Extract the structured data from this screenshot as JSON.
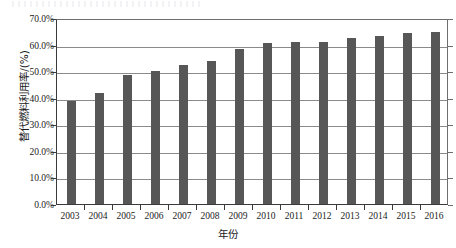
{
  "chart_data": {
    "type": "bar",
    "title": "",
    "xlabel": "年份",
    "ylabel": "替代燃料利用率/(%)",
    "categories": [
      "2003",
      "2004",
      "2005",
      "2006",
      "2007",
      "2008",
      "2009",
      "2010",
      "2011",
      "2012",
      "2013",
      "2014",
      "2015",
      "2016"
    ],
    "values": [
      38.7,
      41.8,
      48.5,
      50.0,
      52.2,
      53.8,
      58.3,
      60.7,
      60.8,
      60.8,
      62.4,
      63.2,
      64.3,
      64.6
    ],
    "series": [
      {
        "name": "替代燃料利用率",
        "values": [
          38.7,
          41.8,
          48.5,
          50.0,
          52.2,
          53.8,
          58.3,
          60.7,
          60.8,
          60.8,
          62.4,
          63.2,
          64.3,
          64.6
        ]
      }
    ],
    "ylim": [
      0,
      70
    ],
    "ytick_values": [
      0,
      10,
      20,
      30,
      40,
      50,
      60,
      70
    ],
    "ytick_labels": [
      "0.0%",
      "10.0%",
      "20.0%",
      "30.0%",
      "40.0%",
      "50.0%",
      "60.0%",
      "70.0%"
    ],
    "grid": true,
    "grid_axis": "y",
    "legend": false,
    "legend_position": "none",
    "bar_color": "#575757",
    "grid_color": "#8a8a8a",
    "axis_color": "#3a3a3a",
    "background_color": "#ffffff"
  }
}
